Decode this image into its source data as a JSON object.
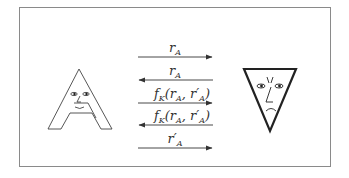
{
  "diagram": {
    "type": "protocol-sequence",
    "participants": [
      {
        "id": "A",
        "name": "A",
        "depiction": "letter-A-with-smiling-face",
        "side": "left"
      },
      {
        "id": "B",
        "name": "inverted-triangle",
        "depiction": "inverted-triangle-with-frowning-face",
        "side": "right"
      }
    ],
    "messages": [
      {
        "order": 1,
        "direction": "right",
        "label_base": "r",
        "label_sub": "A",
        "label_text": "r_A"
      },
      {
        "order": 2,
        "direction": "left",
        "label_base": "r",
        "label_sub": "A",
        "label_text": "r_A"
      },
      {
        "order": 3,
        "direction": "right",
        "label_fn": "f",
        "label_fn_sub": "K",
        "label_text": "f_K(r_A, r'_A)"
      },
      {
        "order": 4,
        "direction": "left",
        "label_fn": "f",
        "label_fn_sub": "K",
        "label_text": "f_K(r_A, r'_A)"
      },
      {
        "order": 5,
        "direction": "right",
        "label_base": "r′",
        "label_sub": "A",
        "label_text": "r'_A"
      }
    ],
    "colors": {
      "stroke": "#333333",
      "frame": "#8a8a8a",
      "background": "#ffffff"
    }
  }
}
